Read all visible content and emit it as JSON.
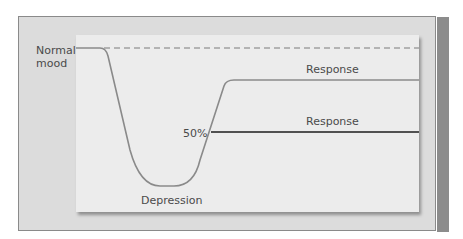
{
  "diagram": {
    "labels": {
      "normal_mood_line1": "Normal",
      "normal_mood_line2": "mood",
      "depression": "Depression",
      "fifty_percent": "50%",
      "response_upper": "Response",
      "response_lower": "Response"
    },
    "lines": {
      "baseline": {
        "style": "dashed",
        "color": "#7a7a7a"
      },
      "mood_curve": {
        "style": "solid",
        "color": "#8a8a8a"
      },
      "response_upper": {
        "style": "solid",
        "color": "#8a8a8a"
      },
      "response_lower": {
        "style": "solid",
        "color": "#505050"
      }
    },
    "colors": {
      "frame": "#dcdcdc",
      "panel": "#ececec",
      "shadow": "#8c8c8c",
      "text": "#4a4a4a"
    }
  }
}
